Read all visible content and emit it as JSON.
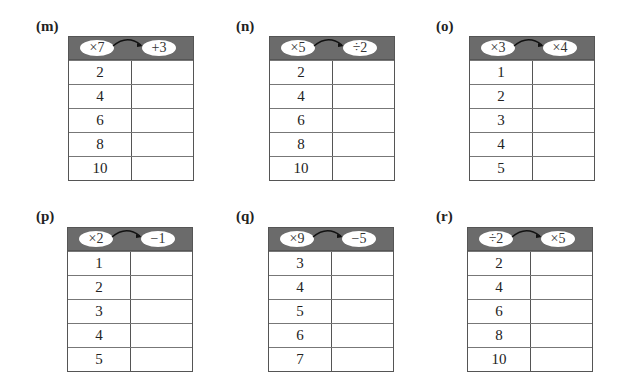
{
  "tables": [
    {
      "label": "(m)",
      "op1": "×7",
      "op2": "+3",
      "inputs": [
        "2",
        "4",
        "6",
        "8",
        "10"
      ]
    },
    {
      "label": "(n)",
      "op1": "×5",
      "op2": "÷2",
      "inputs": [
        "2",
        "4",
        "6",
        "8",
        "10"
      ]
    },
    {
      "label": "(o)",
      "op1": "×3",
      "op2": "×4",
      "inputs": [
        "1",
        "2",
        "3",
        "4",
        "5"
      ]
    },
    {
      "label": "(p)",
      "op1": "×2",
      "op2": "−1",
      "inputs": [
        "1",
        "2",
        "3",
        "4",
        "5"
      ]
    },
    {
      "label": "(q)",
      "op1": "×9",
      "op2": "−5",
      "inputs": [
        "3",
        "4",
        "5",
        "6",
        "7"
      ]
    },
    {
      "label": "(r)",
      "op1": "÷2",
      "op2": "×5",
      "inputs": [
        "2",
        "4",
        "6",
        "8",
        "10"
      ]
    }
  ]
}
